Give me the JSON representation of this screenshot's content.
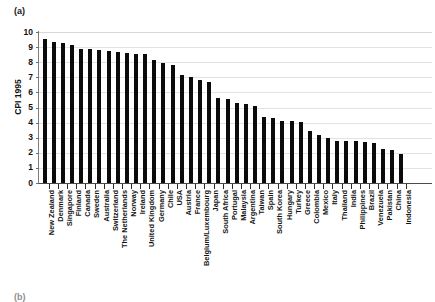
{
  "figure": {
    "panel_label": "(a)",
    "next_panel_label": "(b)",
    "background_color": "#ffffff",
    "bar_color": "#0b0b0b",
    "grid_color": "#e2e2e2",
    "axis_color": "#4a4a4a"
  },
  "chart_data": {
    "type": "bar",
    "title": "",
    "xlabel": "",
    "ylabel": "CPI 1995",
    "ylim": [
      0,
      10
    ],
    "yticks": [
      0,
      1,
      2,
      3,
      4,
      5,
      6,
      7,
      8,
      9,
      10
    ],
    "ytick_labels": [
      "0",
      "1",
      "2",
      "3",
      "4",
      "5",
      "6",
      "7",
      "8",
      "9",
      "10"
    ],
    "grid": true,
    "grid_axis": "y",
    "legend": false,
    "orientation": "vertical",
    "sorted": "descending",
    "categories": [
      "New Zealand",
      "Denmark",
      "Singapore",
      "Finland",
      "Canada",
      "Sweden",
      "Australia",
      "Switzerland",
      "The Netherlands",
      "Norway",
      "Ireland",
      "United Kingdom",
      "Germany",
      "Chile",
      "USA",
      "Austria",
      "France",
      "Belgium/Luxembourg",
      "Japan",
      "South Africa",
      "Portugal",
      "Malaysia",
      "Argentina",
      "Taiwan",
      "Spain",
      "South Korea",
      "Hungary",
      "Turkey",
      "Greece",
      "Colombia",
      "Mexico",
      "Italy",
      "Thailand",
      "India",
      "Philippines",
      "Brazil",
      "Venezuela",
      "Pakistan",
      "China",
      "Indonesia"
    ],
    "values": [
      9.55,
      9.32,
      9.26,
      9.12,
      8.87,
      8.87,
      8.8,
      8.76,
      8.69,
      8.61,
      8.57,
      8.57,
      8.14,
      7.94,
      7.79,
      7.13,
      7.0,
      6.85,
      6.72,
      5.62,
      5.56,
      5.28,
      5.24,
      5.08,
      4.35,
      4.29,
      4.12,
      4.1,
      4.04,
      3.44,
      3.18,
      2.99,
      2.79,
      2.78,
      2.77,
      2.7,
      2.66,
      2.25,
      2.16,
      1.94
    ]
  }
}
